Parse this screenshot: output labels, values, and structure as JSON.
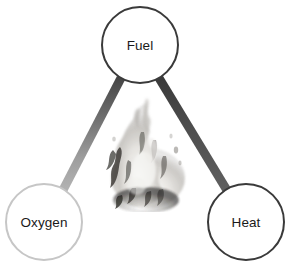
{
  "diagram": {
    "name": "fire-triangle",
    "background_color": "#ffffff",
    "nodes": [
      {
        "id": "fuel",
        "label": "Fuel",
        "position": "top",
        "cx": 140,
        "cy": 45,
        "r": 38,
        "stroke_color": "#3a3a3a",
        "stroke_width": 2,
        "fill_color": "#ffffff",
        "text_color": "#1a1a1a"
      },
      {
        "id": "oxygen",
        "label": "Oxygen",
        "position": "bottom-left",
        "cx": 44,
        "cy": 222,
        "r": 38,
        "stroke_color": "#c6c6c6",
        "stroke_width": 2,
        "fill_color": "#ffffff",
        "text_color": "#1a1a1a"
      },
      {
        "id": "heat",
        "label": "Heat",
        "position": "bottom-right",
        "cx": 246,
        "cy": 222,
        "r": 38,
        "stroke_color": "#3a3a3a",
        "stroke_width": 2,
        "fill_color": "#ffffff",
        "text_color": "#1a1a1a"
      }
    ],
    "edges": [
      {
        "id": "fuel-oxygen",
        "from": "fuel",
        "to": "oxygen",
        "color_start": "#4a4a4a",
        "color_end": "#b0b0b0",
        "width": 9
      },
      {
        "id": "fuel-heat",
        "from": "fuel",
        "to": "heat",
        "color_start": "#3d3d3d",
        "color_end": "#5c5c5c",
        "width": 9
      },
      {
        "id": "oxygen-heat",
        "from": "oxygen",
        "to": "heat",
        "color_start": "#8e8e8e",
        "color_end": "#8a8a8a",
        "width": 9
      }
    ],
    "center_image": {
      "id": "flame",
      "name": "flame-image",
      "description": "Grayscale flame / fire photograph",
      "x": 108,
      "y": 96,
      "width": 80,
      "height": 112,
      "tone": "grayscale"
    }
  }
}
